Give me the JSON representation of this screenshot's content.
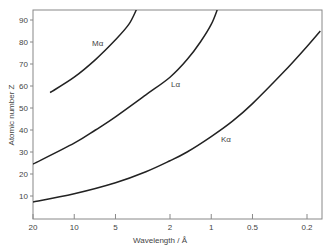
{
  "chart_data": {
    "type": "line",
    "title": "",
    "xlabel": "Wavelength / Å",
    "ylabel": "Atomic number Z",
    "x_scale": "log",
    "x_reversed": true,
    "xlim": [
      20,
      0.16
    ],
    "ylim": [
      0,
      95
    ],
    "x_ticks": [
      20,
      10,
      5,
      2,
      1,
      0.5,
      0.2
    ],
    "x_tick_labels": [
      "20",
      "10",
      "5",
      "2",
      "1",
      "0.5",
      "0.2"
    ],
    "y_ticks": [
      10,
      20,
      30,
      40,
      50,
      60,
      70,
      80,
      90
    ],
    "y_tick_labels": [
      "10",
      "20",
      "30",
      "40",
      "50",
      "60",
      "70",
      "80",
      "90"
    ],
    "grid": false,
    "legend": "none",
    "series": [
      {
        "name": "Kα",
        "label": "Kα",
        "points": [
          [
            20,
            7.3
          ],
          [
            10,
            11
          ],
          [
            5,
            16
          ],
          [
            3,
            21
          ],
          [
            2,
            26
          ],
          [
            1.5,
            30
          ],
          [
            1,
            37
          ],
          [
            0.7,
            44
          ],
          [
            0.5,
            52
          ],
          [
            0.3,
            66
          ],
          [
            0.2,
            78
          ],
          [
            0.16,
            85
          ]
        ]
      },
      {
        "name": "Lα",
        "label": "Lα",
        "points": [
          [
            20,
            24.5
          ],
          [
            10,
            34
          ],
          [
            7,
            40
          ],
          [
            5,
            46
          ],
          [
            3,
            56
          ],
          [
            2,
            64
          ],
          [
            1.5,
            72
          ],
          [
            1.2,
            80
          ],
          [
            1,
            88
          ],
          [
            0.9,
            95
          ]
        ]
      },
      {
        "name": "Mα",
        "label": "Mα",
        "points": [
          [
            15,
            57
          ],
          [
            10,
            64
          ],
          [
            7,
            72
          ],
          [
            5,
            81
          ],
          [
            4,
            88
          ],
          [
            3.5,
            95
          ]
        ]
      }
    ]
  }
}
